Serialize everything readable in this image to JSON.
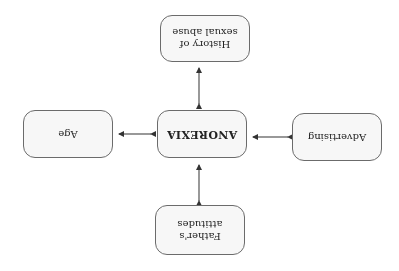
{
  "diagram": {
    "orientation": "rotated-180",
    "center": {
      "label": "ANOREXIA"
    },
    "nodes": {
      "top": {
        "label_line1": "Father's",
        "label_line2": "attitudes"
      },
      "left": {
        "label": "Advertising"
      },
      "right": {
        "label": "Age"
      },
      "bottom": {
        "label_line1": "History of",
        "label_line2": "sexual abuse"
      }
    },
    "edges": [
      {
        "from": "Father's attitudes",
        "to": "ANOREXIA",
        "type": "bidirectional"
      },
      {
        "from": "Advertising",
        "to": "ANOREXIA",
        "type": "bidirectional"
      },
      {
        "from": "Age",
        "to": "ANOREXIA",
        "type": "bidirectional"
      },
      {
        "from": "History of sexual abuse",
        "to": "ANOREXIA",
        "type": "bidirectional"
      }
    ],
    "colors": {
      "border": "#6b6b6b",
      "fill": "#f7f7f7",
      "text": "#222222",
      "arrow": "#333333"
    }
  }
}
